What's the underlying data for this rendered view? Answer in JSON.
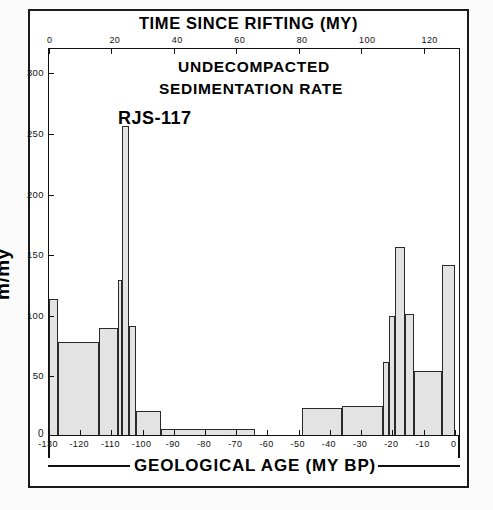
{
  "figure": {
    "top_axis_title": "TIME SINCE RIFTING (MY)",
    "bottom_axis_title": "GEOLOGICAL AGE (MY BP)",
    "y_axis_title": "m/my",
    "heading_line1": "UNDECOMPACTED",
    "heading_line2": "SEDIMENTATION     RATE",
    "well_id": "RJS-117",
    "zero_marker": "0"
  },
  "chart_data": {
    "type": "bar",
    "title": "UNDECOMPACTED SEDIMENTATION RATE",
    "subtitle": "RJS-117",
    "xlabel": "GEOLOGICAL AGE (MY BP)",
    "ylabel": "m/my",
    "secondary_xlabel": "TIME SINCE RIFTING (MY)",
    "grid": false,
    "legend": "none",
    "xlim": [
      -130,
      2
    ],
    "ylim": [
      0,
      320
    ],
    "y_ticks": [
      0,
      50,
      100,
      150,
      200,
      250,
      300
    ],
    "y_tick_labels": [
      "0",
      "50",
      "100",
      "150",
      "200",
      "250",
      "300"
    ],
    "x_ticks": [
      -130,
      -120,
      -110,
      -100,
      -90,
      -80,
      -70,
      -60,
      -50,
      -40,
      -30,
      -20,
      -10,
      0
    ],
    "x_tick_labels": [
      "-130",
      "-120",
      "-110",
      "-100",
      "-90",
      "-80",
      "-70",
      "-60",
      "-50",
      "-40",
      "-30",
      "-20",
      "-10",
      "0"
    ],
    "secondary_x_ticks": [
      0,
      20,
      40,
      60,
      80,
      100,
      120
    ],
    "secondary_x_tick_labels": [
      "0",
      "20",
      "40",
      "60",
      "80",
      "100",
      "120"
    ],
    "secondary_x_mapping": "time_since_rifting = geological_age + 130",
    "bars": [
      {
        "x_start": -130,
        "x_end": -127,
        "value": 112
      },
      {
        "x_start": -127,
        "x_end": -114,
        "value": 77
      },
      {
        "x_start": -114,
        "x_end": -108,
        "value": 88
      },
      {
        "x_start": -108,
        "x_end": -106.5,
        "value": 128
      },
      {
        "x_start": -106.5,
        "x_end": -104.5,
        "value": 255
      },
      {
        "x_start": -104.5,
        "x_end": -102,
        "value": 90
      },
      {
        "x_start": -102,
        "x_end": -94,
        "value": 20
      },
      {
        "x_start": -94,
        "x_end": -64,
        "value": 5
      },
      {
        "x_start": -49,
        "x_end": -36,
        "value": 22
      },
      {
        "x_start": -36,
        "x_end": -23,
        "value": 24
      },
      {
        "x_start": -23,
        "x_end": -21,
        "value": 60
      },
      {
        "x_start": -21,
        "x_end": -19,
        "value": 98
      },
      {
        "x_start": -19,
        "x_end": -16,
        "value": 155
      },
      {
        "x_start": -16,
        "x_end": -13,
        "value": 100
      },
      {
        "x_start": -13,
        "x_end": -4,
        "value": 53
      },
      {
        "x_start": -4,
        "x_end": 0,
        "value": 140
      }
    ]
  }
}
